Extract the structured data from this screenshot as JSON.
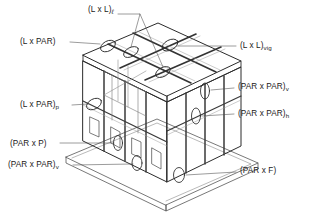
{
  "diagram": {
    "type": "technical-isometric-line-drawing",
    "line_color": "#2b2b2b",
    "thin_line_color": "#6e6e6e",
    "background": "#ffffff",
    "text_color": "#1a1a1a"
  },
  "labels": [
    {
      "id": "l-x-l-l",
      "base": "(L x L)",
      "sub": "ℓ",
      "sub_style": "italic",
      "text": "(L x L)ℓ",
      "position": "top-center",
      "x": 88,
      "y": 6
    },
    {
      "id": "l-x-par",
      "base": "(L x PAR)",
      "sub": "",
      "sub_style": "none",
      "text": "(L x PAR)",
      "position": "upper-left",
      "x": 20,
      "y": 38
    },
    {
      "id": "l-x-l-vig",
      "base": "(L x L)",
      "sub": "vig",
      "sub_style": "normal",
      "text": "(L x L)vig",
      "position": "upper-right",
      "x": 240,
      "y": 42
    },
    {
      "id": "par-x-par-v-r",
      "base": "(PAR x PAR)",
      "sub": "v",
      "sub_style": "normal",
      "text": "(PAR x PAR)v",
      "position": "right-upper",
      "x": 238,
      "y": 83
    },
    {
      "id": "l-x-par-p",
      "base": "(L x PAR)",
      "sub": "p",
      "sub_style": "normal",
      "text": "(L x PAR)p",
      "position": "left-middle",
      "x": 20,
      "y": 101
    },
    {
      "id": "par-x-par-h",
      "base": "(PAR x PAR)",
      "sub": "h",
      "sub_style": "normal",
      "text": "(PAR x PAR)h",
      "position": "right-lower",
      "x": 238,
      "y": 110
    },
    {
      "id": "par-x-p",
      "base": "(PAR x P)",
      "sub": "",
      "sub_style": "none",
      "text": "(PAR x P)",
      "position": "lower-left",
      "x": 10,
      "y": 140
    },
    {
      "id": "par-x-par-v-b",
      "base": "(PAR x PAR)",
      "sub": "v",
      "sub_style": "normal",
      "text": "(PAR x PAR)v",
      "position": "bottom-left",
      "x": 8,
      "y": 161
    },
    {
      "id": "par-x-f",
      "base": "(PAR x F)",
      "sub": "",
      "sub_style": "none",
      "text": "(PAR x F)",
      "position": "bottom-right",
      "x": 240,
      "y": 167
    }
  ],
  "markers": [
    {
      "id": "marker-roof-left",
      "cx": 108,
      "cy": 46,
      "rx": 8,
      "ry": 5,
      "rot": -28
    },
    {
      "id": "marker-roof-mid-left",
      "cx": 131,
      "cy": 52,
      "rx": 8,
      "ry": 4.5,
      "rot": -28
    },
    {
      "id": "marker-roof-right",
      "cx": 170,
      "cy": 45,
      "rx": 8.5,
      "ry": 5,
      "rot": -28
    },
    {
      "id": "marker-roof-mid-low",
      "cx": 163,
      "cy": 72,
      "rx": 8,
      "ry": 4.5,
      "rot": -28
    },
    {
      "id": "marker-side-upper",
      "cx": 205,
      "cy": 91,
      "rx": 4.5,
      "ry": 8,
      "rot": 0
    },
    {
      "id": "marker-side-lower",
      "cx": 196,
      "cy": 116,
      "rx": 4.5,
      "ry": 8,
      "rot": 0
    },
    {
      "id": "marker-front-left-top",
      "cx": 94,
      "cy": 104,
      "rx": 8,
      "ry": 5,
      "rot": -28
    },
    {
      "id": "marker-front-mid",
      "cx": 118,
      "cy": 143,
      "rx": 4.5,
      "ry": 7.5,
      "rot": 0
    },
    {
      "id": "marker-front-low",
      "cx": 137,
      "cy": 163,
      "rx": 5,
      "ry": 7.5,
      "rot": 0
    },
    {
      "id": "marker-base-right",
      "cx": 179,
      "cy": 175,
      "rx": 5.5,
      "ry": 7.5,
      "rot": 0
    }
  ],
  "structure": {
    "parts": [
      "floor-slab",
      "roof-panel-grid",
      "front-facade",
      "right-facade",
      "interior-frame"
    ],
    "roof_panel_rows": 2,
    "roof_panel_cols": 3,
    "front_openings": 6,
    "right_panel_strips": 3
  }
}
